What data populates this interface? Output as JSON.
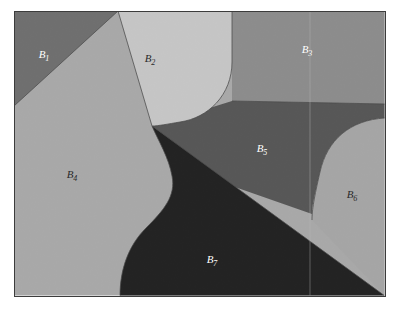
{
  "figure": {
    "kind": "partition-diagram",
    "background_color": "#ffffff",
    "frame": {
      "border_color": "#3c3c3c",
      "border_width_px": 1,
      "x": 14,
      "y": 11,
      "width": 371,
      "height": 285
    },
    "regions": [
      {
        "id": "B1",
        "label": "B",
        "subscript": "1",
        "fill": "#6f6f6f",
        "label_color": "#ffffff",
        "label_x": 44,
        "label_y": 58,
        "shape": "triangle-top-left"
      },
      {
        "id": "B2",
        "label": "B",
        "subscript": "2",
        "fill": "#c9c9c9",
        "label_color": "#2a2a2a",
        "label_x": 150,
        "label_y": 62,
        "shape": "rounded-lobe-top-center"
      },
      {
        "id": "B3",
        "label": "B",
        "subscript": "3",
        "fill": "#8d8d8d",
        "label_color": "#ffffff",
        "label_x": 307,
        "label_y": 53,
        "shape": "band-top-right"
      },
      {
        "id": "B4",
        "label": "B",
        "subscript": "4",
        "fill": "#ababab",
        "label_color": "#2a2a2a",
        "label_x": 72,
        "label_y": 178,
        "shape": "left-middle-with-s-curve"
      },
      {
        "id": "B5",
        "label": "B",
        "subscript": "5",
        "fill": "#555555",
        "label_color": "#ffffff",
        "label_x": 262,
        "label_y": 152,
        "shape": "center-right-dark"
      },
      {
        "id": "B6",
        "label": "B",
        "subscript": "6",
        "fill": "#a8a8a8",
        "label_color": "#2a2a2a",
        "label_x": 352,
        "label_y": 198,
        "shape": "right-wedge"
      },
      {
        "id": "B7",
        "label": "B",
        "subscript": "7",
        "fill": "#1e1e1e",
        "label_color": "#ffffff",
        "label_x": 212,
        "label_y": 263,
        "shape": "bottom-dark"
      }
    ],
    "seam": {
      "color": "#bdbdbd",
      "x": 310,
      "description": "faint vertical scan seam artifact"
    }
  }
}
